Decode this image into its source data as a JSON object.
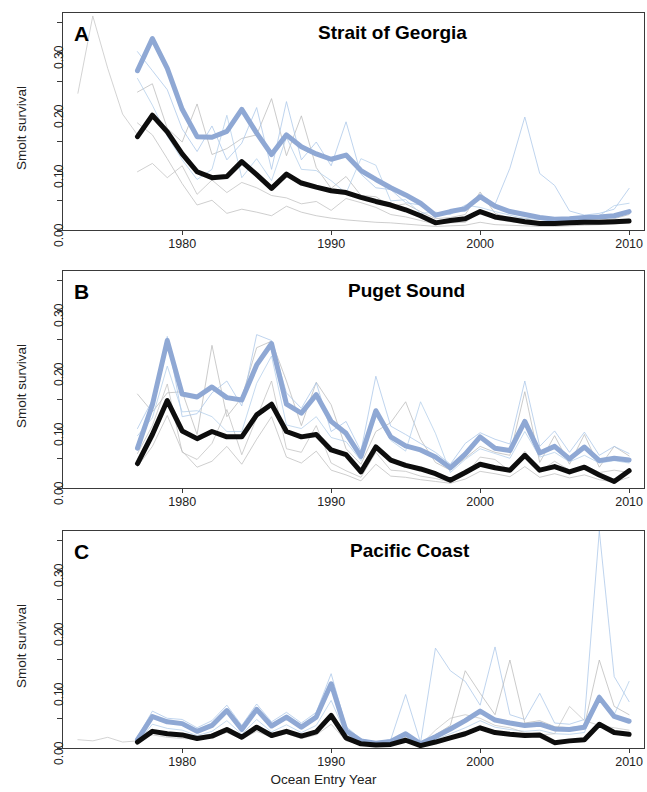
{
  "figure": {
    "xlabel": "Ocean Entry Year",
    "ylabel": "Smolt survival",
    "xticks": [
      "1980",
      "1990",
      "2000",
      "2010"
    ],
    "xtick_values": [
      1980,
      1990,
      2000,
      2010
    ],
    "yticks": [
      "0.00",
      "0.10",
      "0.20",
      "0.30"
    ],
    "ytick_values": [
      0.0,
      0.1,
      0.2,
      0.3
    ],
    "colors": {
      "bold_black": "#0d0d0d",
      "bold_blue": "#8fa8d4",
      "faint_blue": "#a9c6e8",
      "faint_gray": "#b9b9b9",
      "axis": "#3a3a3a",
      "background": "#ffffff"
    }
  },
  "panels": [
    {
      "letter": "A",
      "title": "Strait of Georgia"
    },
    {
      "letter": "B",
      "title": "Puget Sound"
    },
    {
      "letter": "C",
      "title": "Pacific Coast"
    }
  ],
  "chart_data": [
    {
      "type": "line",
      "panel": "A",
      "title": "Strait of Georgia",
      "xlabel": "Ocean Entry Year",
      "ylabel": "Smolt survival",
      "xlim": [
        1972,
        2011
      ],
      "ylim": [
        0.0,
        0.365
      ],
      "grid": false,
      "legend": "none",
      "x": [
        1977,
        1978,
        1979,
        1980,
        1981,
        1982,
        1983,
        1984,
        1985,
        1986,
        1987,
        1988,
        1989,
        1990,
        1991,
        1992,
        1993,
        1994,
        1995,
        1996,
        1997,
        1998,
        1999,
        2000,
        2001,
        2002,
        2003,
        2004,
        2005,
        2006,
        2007,
        2008,
        2009,
        2010
      ],
      "series": [
        {
          "name": "mean (blue, bold)",
          "color": "#8fa8d4",
          "width": 5,
          "values": [
            0.268,
            0.322,
            0.272,
            0.203,
            0.157,
            0.156,
            0.166,
            0.203,
            0.163,
            0.127,
            0.16,
            0.14,
            0.128,
            0.119,
            0.126,
            0.1,
            0.085,
            0.071,
            0.059,
            0.045,
            0.025,
            0.031,
            0.036,
            0.056,
            0.04,
            0.031,
            0.026,
            0.021,
            0.018,
            0.019,
            0.021,
            0.022,
            0.024,
            0.031
          ]
        },
        {
          "name": "median (black, bold)",
          "color": "#0d0d0d",
          "width": 5,
          "values": [
            0.157,
            0.193,
            0.165,
            0.128,
            0.098,
            0.088,
            0.09,
            0.115,
            0.093,
            0.07,
            0.094,
            0.079,
            0.072,
            0.066,
            0.063,
            0.055,
            0.048,
            0.042,
            0.034,
            0.024,
            0.012,
            0.016,
            0.019,
            0.031,
            0.022,
            0.018,
            0.014,
            0.011,
            0.011,
            0.012,
            0.013,
            0.013,
            0.014,
            0.015
          ]
        },
        {
          "name": "stock 1 (faint gray)",
          "color": "#b9b9b9",
          "width": 1,
          "values": [
            0.232,
            0.246,
            0.171,
            0.148,
            0.212,
            0.127,
            0.137,
            0.154,
            0.16,
            0.221,
            0.125,
            0.192,
            0.105,
            0.07,
            0.09,
            0.058,
            0.056,
            0.04,
            0.044,
            0.031,
            0.019,
            0.021,
            0.026,
            0.064,
            0.028,
            0.02,
            0.02,
            0.013,
            0.011,
            0.016,
            0.015,
            0.016,
            0.019,
            0.026
          ]
        },
        {
          "name": "stock 2 (faint gray)",
          "color": "#c0c0c0",
          "width": 1,
          "values": [
            0.098,
            0.112,
            0.088,
            0.108,
            0.06,
            0.084,
            0.063,
            0.08,
            0.071,
            0.058,
            0.054,
            0.044,
            0.048,
            0.033,
            0.053,
            0.046,
            0.038,
            0.026,
            0.022,
            0.016,
            0.01,
            0.012,
            0.013,
            0.03,
            0.018,
            0.014,
            0.011,
            0.009,
            0.008,
            0.01,
            0.011,
            0.012,
            0.012,
            0.014
          ]
        },
        {
          "name": "stock 3 (faint blue)",
          "color": "#a9c6e8",
          "width": 1,
          "values": [
            0.3,
            0.268,
            0.236,
            0.17,
            0.132,
            0.175,
            0.118,
            0.146,
            0.206,
            0.102,
            0.216,
            0.118,
            0.148,
            0.108,
            0.182,
            0.094,
            0.071,
            0.068,
            0.046,
            0.042,
            0.022,
            0.034,
            0.031,
            0.061,
            0.043,
            0.104,
            0.19,
            0.095,
            0.075,
            0.032,
            0.025,
            0.028,
            0.035,
            0.07
          ]
        },
        {
          "name": "stock 4 (faint blue)",
          "color": "#b2cdea",
          "width": 1,
          "values": [
            0.255,
            0.21,
            0.158,
            0.118,
            0.085,
            0.102,
            0.193,
            0.088,
            0.12,
            0.083,
            0.156,
            0.102,
            0.1,
            0.083,
            0.062,
            0.12,
            0.109,
            0.049,
            0.051,
            0.028,
            0.03,
            0.026,
            0.042,
            0.038,
            0.031,
            0.025,
            0.019,
            0.018,
            0.015,
            0.017,
            0.023,
            0.024,
            0.041,
            0.045
          ]
        },
        {
          "name": "stock 5 (faint gray)",
          "color": "#bdbdbd",
          "width": 1,
          "values": [
            0.18,
            0.16,
            0.12,
            0.078,
            0.042,
            0.05,
            0.028,
            0.035,
            0.03,
            0.024,
            0.04,
            0.03,
            0.024,
            0.02,
            0.017,
            0.015,
            0.013,
            0.012,
            0.01,
            0.008,
            0.006,
            0.007,
            0.008,
            0.013,
            0.009,
            0.008,
            0.007,
            0.006,
            0.006,
            0.007,
            0.008,
            0.009,
            0.01,
            0.012
          ]
        },
        {
          "name": "early stock (faint gray, pre-1977)",
          "color": "#c4c4c4",
          "width": 1,
          "x_start": 1973,
          "values": [
            0.23,
            0.36,
            0.272,
            0.195,
            0.16
          ]
        }
      ]
    },
    {
      "type": "line",
      "panel": "B",
      "title": "Puget Sound",
      "xlabel": "Ocean Entry Year",
      "ylabel": "Smolt survival",
      "xlim": [
        1972,
        2011
      ],
      "ylim": [
        0.0,
        0.365
      ],
      "grid": false,
      "legend": "none",
      "x": [
        1977,
        1978,
        1979,
        1980,
        1981,
        1982,
        1983,
        1984,
        1985,
        1986,
        1987,
        1988,
        1989,
        1990,
        1991,
        1992,
        1993,
        1994,
        1995,
        1996,
        1997,
        1998,
        1999,
        2000,
        2001,
        2002,
        2003,
        2004,
        2005,
        2006,
        2007,
        2008,
        2009,
        2010
      ],
      "series": [
        {
          "name": "mean (blue, bold)",
          "color": "#8fa8d4",
          "width": 5,
          "values": [
            0.067,
            0.14,
            0.248,
            0.158,
            0.153,
            0.17,
            0.152,
            0.148,
            0.207,
            0.243,
            0.141,
            0.126,
            0.157,
            0.112,
            0.092,
            0.053,
            0.13,
            0.086,
            0.071,
            0.064,
            0.052,
            0.034,
            0.057,
            0.086,
            0.067,
            0.063,
            0.112,
            0.059,
            0.07,
            0.049,
            0.069,
            0.046,
            0.05,
            0.047
          ]
        },
        {
          "name": "median (black, bold)",
          "color": "#0d0d0d",
          "width": 5,
          "values": [
            0.041,
            0.09,
            0.147,
            0.096,
            0.083,
            0.095,
            0.086,
            0.086,
            0.123,
            0.141,
            0.095,
            0.086,
            0.09,
            0.064,
            0.056,
            0.027,
            0.069,
            0.047,
            0.038,
            0.032,
            0.024,
            0.013,
            0.026,
            0.04,
            0.034,
            0.03,
            0.055,
            0.03,
            0.036,
            0.027,
            0.035,
            0.022,
            0.011,
            0.029
          ]
        },
        {
          "name": "stock 1 (faint gray)",
          "color": "#b9b9b9",
          "width": 1,
          "values": [
            0.158,
            0.128,
            0.16,
            0.162,
            0.09,
            0.24,
            0.12,
            0.152,
            0.236,
            0.247,
            0.18,
            0.105,
            0.178,
            0.14,
            0.066,
            0.04,
            0.095,
            0.11,
            0.145,
            0.082,
            0.043,
            0.03,
            0.05,
            0.07,
            0.06,
            0.055,
            0.162,
            0.043,
            0.088,
            0.04,
            0.09,
            0.035,
            0.07,
            0.054
          ]
        },
        {
          "name": "stock 2 (faint gray)",
          "color": "#c0c0c0",
          "width": 1,
          "values": [
            0.058,
            0.105,
            0.175,
            0.06,
            0.048,
            0.075,
            0.132,
            0.056,
            0.118,
            0.18,
            0.066,
            0.06,
            0.105,
            0.042,
            0.029,
            0.018,
            0.06,
            0.03,
            0.028,
            0.02,
            0.016,
            0.01,
            0.022,
            0.052,
            0.048,
            0.028,
            0.062,
            0.028,
            0.045,
            0.03,
            0.038,
            0.026,
            0.03,
            0.026
          ]
        },
        {
          "name": "stock 3 (faint blue)",
          "color": "#a9c6e8",
          "width": 1,
          "values": [
            0.1,
            0.148,
            0.255,
            0.12,
            0.125,
            0.16,
            0.18,
            0.138,
            0.258,
            0.248,
            0.16,
            0.134,
            0.177,
            0.095,
            0.112,
            0.062,
            0.188,
            0.104,
            0.09,
            0.075,
            0.06,
            0.04,
            0.075,
            0.093,
            0.082,
            0.074,
            0.18,
            0.07,
            0.096,
            0.06,
            0.094,
            0.055,
            0.07,
            0.058
          ]
        },
        {
          "name": "stock 4 (faint blue)",
          "color": "#b2cdea",
          "width": 1,
          "values": [
            0.088,
            0.118,
            0.205,
            0.128,
            0.13,
            0.12,
            0.095,
            0.095,
            0.176,
            0.222,
            0.106,
            0.1,
            0.12,
            0.085,
            0.078,
            0.046,
            0.122,
            0.08,
            0.062,
            0.145,
            0.092,
            0.026,
            0.048,
            0.066,
            0.058,
            0.05,
            0.095,
            0.052,
            0.06,
            0.044,
            0.055,
            0.042,
            0.046,
            0.042
          ]
        },
        {
          "name": "stock 5 (faint gray)",
          "color": "#bdbdbd",
          "width": 1,
          "values": [
            0.036,
            0.07,
            0.122,
            0.062,
            0.035,
            0.045,
            0.07,
            0.04,
            0.082,
            0.12,
            0.052,
            0.042,
            0.062,
            0.03,
            0.022,
            0.012,
            0.04,
            0.02,
            0.018,
            0.014,
            0.011,
            0.008,
            0.015,
            0.028,
            0.024,
            0.019,
            0.036,
            0.018,
            0.024,
            0.017,
            0.022,
            0.014,
            0.01,
            0.018
          ]
        }
      ]
    },
    {
      "type": "line",
      "panel": "C",
      "title": "Pacific Coast",
      "xlabel": "Ocean Entry Year",
      "ylabel": "Smolt survival",
      "xlim": [
        1972,
        2011
      ],
      "ylim": [
        0.0,
        0.365
      ],
      "grid": false,
      "legend": "none",
      "x": [
        1977,
        1978,
        1979,
        1980,
        1981,
        1982,
        1983,
        1984,
        1985,
        1986,
        1987,
        1988,
        1989,
        1990,
        1991,
        1992,
        1993,
        1994,
        1995,
        1996,
        1997,
        1998,
        1999,
        2000,
        2001,
        2002,
        2003,
        2004,
        2005,
        2006,
        2007,
        2008,
        2009,
        2010
      ],
      "series": [
        {
          "name": "mean (blue, bold)",
          "color": "#8fa8d4",
          "width": 5,
          "values": [
            0.014,
            0.053,
            0.044,
            0.041,
            0.028,
            0.038,
            0.063,
            0.031,
            0.065,
            0.037,
            0.052,
            0.035,
            0.052,
            0.108,
            0.029,
            0.012,
            0.008,
            0.011,
            0.024,
            0.007,
            0.019,
            0.032,
            0.046,
            0.062,
            0.047,
            0.042,
            0.038,
            0.04,
            0.032,
            0.031,
            0.035,
            0.085,
            0.053,
            0.045
          ]
        },
        {
          "name": "median (black, bold)",
          "color": "#0d0d0d",
          "width": 5,
          "values": [
            0.01,
            0.028,
            0.024,
            0.022,
            0.016,
            0.02,
            0.031,
            0.018,
            0.035,
            0.021,
            0.028,
            0.02,
            0.027,
            0.055,
            0.017,
            0.007,
            0.005,
            0.006,
            0.013,
            0.004,
            0.01,
            0.017,
            0.024,
            0.034,
            0.026,
            0.023,
            0.021,
            0.022,
            0.009,
            0.012,
            0.014,
            0.04,
            0.026,
            0.023
          ]
        },
        {
          "name": "stock 1 (faint blue)",
          "color": "#a9c6e8",
          "width": 1,
          "values": [
            0.018,
            0.062,
            0.05,
            0.048,
            0.034,
            0.046,
            0.072,
            0.038,
            0.074,
            0.044,
            0.06,
            0.042,
            0.06,
            0.125,
            0.036,
            0.015,
            0.01,
            0.014,
            0.09,
            0.009,
            0.168,
            0.13,
            0.112,
            0.072,
            0.17,
            0.056,
            0.048,
            0.092,
            0.042,
            0.04,
            0.048,
            0.365,
            0.12,
            0.078
          ]
        },
        {
          "name": "stock 2 (faint gray)",
          "color": "#b9b9b9",
          "width": 1,
          "values": [
            0.02,
            0.03,
            0.026,
            0.024,
            0.019,
            0.024,
            0.033,
            0.021,
            0.036,
            0.024,
            0.03,
            0.022,
            0.03,
            0.048,
            0.02,
            0.01,
            0.007,
            0.009,
            0.018,
            0.006,
            0.022,
            0.038,
            0.13,
            0.092,
            0.056,
            0.148,
            0.042,
            0.046,
            0.036,
            0.034,
            0.038,
            0.148,
            0.07,
            0.056
          ]
        },
        {
          "name": "stock 3 (faint blue)",
          "color": "#b2cdea",
          "width": 1,
          "values": [
            0.009,
            0.04,
            0.033,
            0.03,
            0.021,
            0.028,
            0.046,
            0.023,
            0.048,
            0.027,
            0.039,
            0.026,
            0.038,
            0.08,
            0.022,
            0.009,
            0.006,
            0.008,
            0.016,
            0.005,
            0.014,
            0.024,
            0.034,
            0.046,
            0.035,
            0.031,
            0.028,
            0.03,
            0.024,
            0.023,
            0.026,
            0.09,
            0.056,
            0.112
          ]
        },
        {
          "name": "stock 4 (faint gray)",
          "color": "#c4c4c4",
          "width": 1,
          "x_start": 1973,
          "values": [
            0.014,
            0.012,
            0.018,
            0.01,
            0.012,
            0.022,
            0.018,
            0.016,
            0.014,
            0.019,
            0.026,
            0.015,
            0.028,
            0.018,
            0.024,
            0.016,
            0.022,
            0.04,
            0.012,
            0.006,
            0.004,
            0.007,
            0.014,
            0.005,
            0.03,
            0.05,
            0.056,
            0.05,
            0.038,
            0.034,
            0.026,
            0.022,
            0.024,
            0.07,
            0.046,
            0.038,
            0.034,
            0.03
          ]
        }
      ]
    }
  ]
}
